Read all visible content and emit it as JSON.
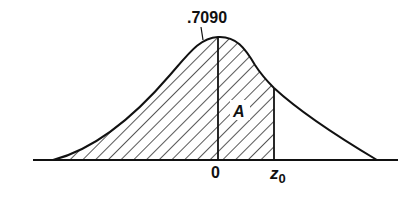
{
  "diagram": {
    "type": "normal-distribution-shaded-area",
    "labels": {
      "peak_value": ".7090",
      "origin": "0",
      "z_base": "z",
      "z_subscript": "0",
      "area": "A"
    },
    "colors": {
      "stroke": "#111111",
      "hatch": "#111111",
      "background": "#ffffff"
    },
    "shaded_region": "from left tail to z0 (hatched)"
  }
}
